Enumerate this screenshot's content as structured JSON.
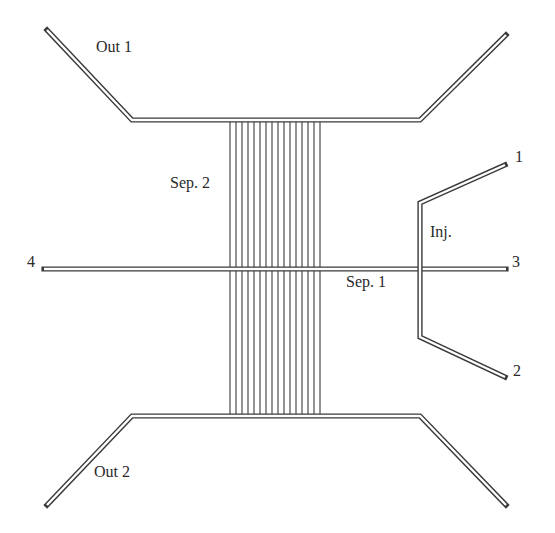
{
  "diagram": {
    "width": 555,
    "height": 533,
    "colors": {
      "stroke": "#3a3a3a",
      "background": "#ffffff",
      "text": "#2a2a2a"
    },
    "labels": {
      "out1": {
        "text": "Out 1",
        "x": 96,
        "y": 47
      },
      "out2": {
        "text": "Out 2",
        "x": 94,
        "y": 472
      },
      "sep2": {
        "text": "Sep. 2",
        "x": 170,
        "y": 183
      },
      "sep1": {
        "text": "Sep. 1",
        "x": 346,
        "y": 282
      },
      "inj": {
        "text": "Inj.",
        "x": 430,
        "y": 232
      },
      "port1": {
        "text": "1",
        "x": 515,
        "y": 157
      },
      "port2": {
        "text": "2",
        "x": 513,
        "y": 371
      },
      "port3": {
        "text": "3",
        "x": 512,
        "y": 262
      },
      "port4": {
        "text": "4",
        "x": 27,
        "y": 262
      }
    },
    "channels": {
      "out1": [
        [
          47,
          30
        ],
        [
          132,
          120
        ],
        [
          420,
          120
        ],
        [
          506,
          35
        ]
      ],
      "out2": [
        [
          47,
          505
        ],
        [
          132,
          416
        ],
        [
          420,
          416
        ],
        [
          506,
          505
        ]
      ],
      "sep1": [
        [
          44,
          269
        ],
        [
          506,
          269
        ]
      ],
      "inj": [
        [
          505,
          165
        ],
        [
          420,
          203
        ],
        [
          420,
          337
        ],
        [
          505,
          377
        ]
      ]
    },
    "sep2_lines": {
      "y_top": 122,
      "y_bottom": 414,
      "x": [
        230,
        236,
        242,
        248,
        254,
        260,
        266,
        272,
        278,
        284,
        290,
        296,
        302,
        308,
        314,
        320
      ]
    }
  }
}
